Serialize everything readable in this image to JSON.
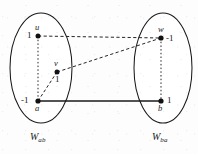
{
  "figure": {
    "kind": "graph-diagram",
    "background_color": "#fdfdfd",
    "stroke_color": "#1a1a1a",
    "sets": [
      {
        "id": "left",
        "label_main": "W",
        "label_subscript": "ab",
        "label_full": "W_ab",
        "center": [
          41,
          68
        ],
        "rx": 31,
        "ry": 55
      },
      {
        "id": "right",
        "label_main": "W",
        "label_subscript": "ba",
        "label_full": "W_ba",
        "center": [
          163,
          68
        ],
        "rx": 29,
        "ry": 55
      }
    ],
    "vertices": [
      {
        "id": "u",
        "name": "u",
        "value": "1",
        "x": 38,
        "y": 36,
        "set": "left",
        "name_pos": "above",
        "value_pos": "left"
      },
      {
        "id": "v",
        "name": "v",
        "value": "1",
        "x": 57,
        "y": 72,
        "set": "left",
        "name_pos": "above",
        "value_pos": "below"
      },
      {
        "id": "a",
        "name": "a",
        "value": "-1",
        "x": 38,
        "y": 101,
        "set": "left",
        "name_pos": "below",
        "value_pos": "left"
      },
      {
        "id": "w",
        "name": "w",
        "value": "-1",
        "x": 161,
        "y": 38,
        "set": "right",
        "name_pos": "above",
        "value_pos": "right"
      },
      {
        "id": "b",
        "name": "b",
        "value": "1",
        "x": 161,
        "y": 101,
        "set": "right",
        "name_pos": "below",
        "value_pos": "right"
      }
    ],
    "edges": [
      {
        "id": "u-w",
        "from": "u",
        "to": "w",
        "style": "dashed",
        "x1": 38,
        "y1": 36,
        "x2": 161,
        "y2": 38
      },
      {
        "id": "v-w",
        "from": "v",
        "to": "w",
        "style": "dashed",
        "x1": 57,
        "y1": 72,
        "x2": 161,
        "y2": 38
      },
      {
        "id": "a-v",
        "from": "a",
        "to": "v",
        "style": "dashed",
        "x1": 38,
        "y1": 101,
        "x2": 57,
        "y2": 72
      },
      {
        "id": "a-b",
        "from": "a",
        "to": "b",
        "style": "solid",
        "x1": 38,
        "y1": 101,
        "x2": 161,
        "y2": 101
      },
      {
        "id": "u-a",
        "from": "u",
        "to": "a",
        "style": "dotted",
        "x1": 38,
        "y1": 36,
        "x2": 38,
        "y2": 101
      },
      {
        "id": "w-b",
        "from": "w",
        "to": "b",
        "style": "dotted",
        "x1": 161,
        "y1": 38,
        "x2": 161,
        "y2": 101
      }
    ]
  }
}
